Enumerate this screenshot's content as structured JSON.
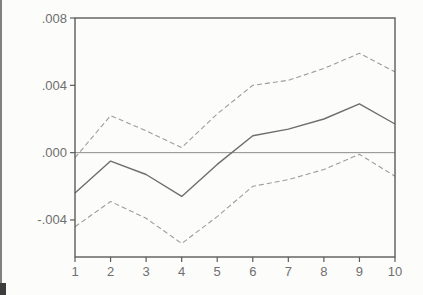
{
  "chart_data": {
    "type": "line",
    "title": "",
    "xlabel": "",
    "ylabel": "",
    "x": [
      1,
      2,
      3,
      4,
      5,
      6,
      7,
      8,
      9,
      10
    ],
    "series": [
      {
        "name": "response",
        "style": "solid",
        "color": "#6e6e6e",
        "values": [
          -0.0024,
          -0.0005,
          -0.0013,
          -0.0026,
          -0.0007,
          0.001,
          0.0014,
          0.002,
          0.0029,
          0.0017
        ]
      },
      {
        "name": "upper_band",
        "style": "dashed",
        "color": "#9c9c9c",
        "values": [
          -0.0003,
          0.0022,
          0.0013,
          0.0003,
          0.0023,
          0.004,
          0.0043,
          0.005,
          0.0059,
          0.0048
        ]
      },
      {
        "name": "lower_band",
        "style": "dashed",
        "color": "#9c9c9c",
        "values": [
          -0.0044,
          -0.0029,
          -0.0039,
          -0.0054,
          -0.0038,
          -0.002,
          -0.0016,
          -0.001,
          -0.0001,
          -0.0014
        ]
      }
    ],
    "xlim": [
      1,
      10
    ],
    "ylim": [
      -0.0062,
      0.008
    ],
    "y_ticks": [
      {
        "value": 0.008,
        "label": ".008"
      },
      {
        "value": 0.004,
        "label": ".004"
      },
      {
        "value": 0.0,
        "label": ".000"
      },
      {
        "value": -0.004,
        "label": "-.004"
      }
    ],
    "x_ticks": [
      {
        "value": 1,
        "label": "1"
      },
      {
        "value": 2,
        "label": "2"
      },
      {
        "value": 3,
        "label": "3"
      },
      {
        "value": 4,
        "label": "4"
      },
      {
        "value": 5,
        "label": "5"
      },
      {
        "value": 6,
        "label": "6"
      },
      {
        "value": 7,
        "label": "7"
      },
      {
        "value": 8,
        "label": "8"
      },
      {
        "value": 9,
        "label": "9"
      },
      {
        "value": 10,
        "label": "10"
      }
    ],
    "zero_line": true,
    "grid": false,
    "legend": "none",
    "frame": true
  },
  "colors": {
    "background": "#fcfcfb",
    "frame": "#5c5c5c",
    "tick": "#5c5c5c",
    "tick_label": "#6f6f6f",
    "zero_line": "#8d8d8d"
  }
}
